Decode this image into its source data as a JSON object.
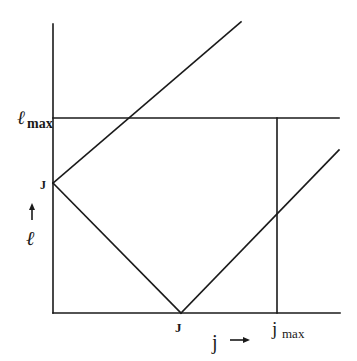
{
  "diagram": {
    "axes": {
      "vertical_label": "ℓ",
      "vertical_arrow": "↑",
      "horizontal_label": "j",
      "horizontal_arrow": "→"
    },
    "labels": {
      "l_max": {
        "main": "ℓ",
        "sub": "max"
      },
      "j_max": {
        "main": "j",
        "sub": "max"
      },
      "J_left": "J",
      "J_bottom": "J"
    },
    "lines": [
      {
        "name": "vertical-axis",
        "from": [
          53,
          24
        ],
        "to": [
          53,
          313
        ]
      },
      {
        "name": "horizontal-axis",
        "from": [
          53,
          313
        ],
        "to": [
          340,
          313
        ]
      },
      {
        "name": "l-max-line",
        "from": [
          53,
          118
        ],
        "to": [
          339,
          118
        ]
      },
      {
        "name": "j-max-line",
        "from": [
          277,
          118
        ],
        "to": [
          277,
          313
        ]
      },
      {
        "name": "upper-diagonal",
        "from": [
          53,
          183
        ],
        "to": [
          241,
          22
        ]
      },
      {
        "name": "descending-diagonal",
        "from": [
          53,
          183
        ],
        "to": [
          181,
          313
        ]
      },
      {
        "name": "ascending-diagonal",
        "from": [
          181,
          313
        ],
        "to": [
          339,
          150
        ]
      }
    ],
    "stroke_color": "#1a1a1a"
  }
}
